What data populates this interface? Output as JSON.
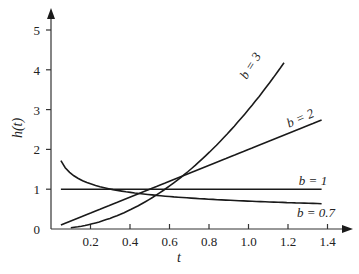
{
  "chart_data": {
    "type": "line",
    "title": "",
    "xlabel": "t",
    "ylabel": "h(t)",
    "xlim": [
      0,
      1.45
    ],
    "ylim": [
      0,
      5.3
    ],
    "xticks": [
      "0.2",
      "0.4",
      "0.6",
      "0.8",
      "1.0",
      "1.2",
      "1.4"
    ],
    "yticks": [
      "0",
      "1",
      "2",
      "3",
      "4",
      "5"
    ],
    "grid": false,
    "legend": "inline labels at curve ends",
    "series": [
      {
        "name": "b = 3",
        "label_text": "b = 3",
        "x": [
          0.1,
          0.3,
          0.5,
          0.7,
          0.9,
          1.1,
          1.18
        ],
        "values": [
          0.03,
          0.27,
          0.75,
          1.47,
          2.43,
          3.63,
          4.18
        ]
      },
      {
        "name": "b = 2",
        "label_text": "b = 2",
        "x": [
          0.05,
          0.4,
          0.8,
          1.2,
          1.37
        ],
        "values": [
          0.1,
          0.8,
          1.6,
          2.4,
          2.74
        ]
      },
      {
        "name": "b = 1",
        "label_text": "b = 1",
        "x": [
          0.05,
          1.37
        ],
        "values": [
          1.0,
          1.0
        ]
      },
      {
        "name": "b = 0.7",
        "label_text": "b = 0.7",
        "x": [
          0.05,
          0.2,
          0.4,
          0.6,
          0.8,
          1.0,
          1.2,
          1.37
        ],
        "values": [
          1.72,
          1.13,
          0.92,
          0.82,
          0.75,
          0.7,
          0.66,
          0.63
        ]
      }
    ]
  }
}
